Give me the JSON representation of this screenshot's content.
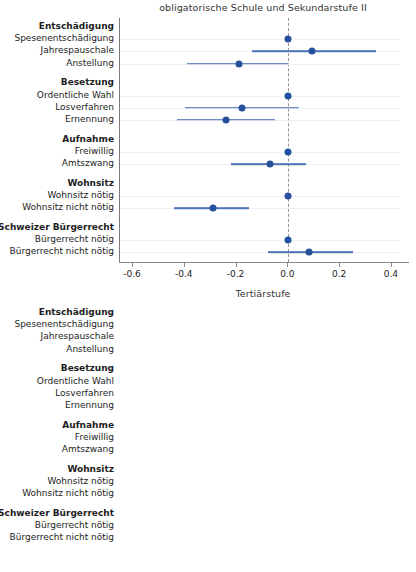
{
  "figure": {
    "width": 416,
    "height": 572,
    "point_color": "#27509b",
    "ci_color": "#4a73b8",
    "zero_line_color": "#9a9287",
    "grid_color": "#eceff4"
  },
  "chart_data": [
    {
      "type": "scatter",
      "title": "obligatorische Schule und Sekundarstufe II",
      "xlabel": "",
      "ylabel": "",
      "xlim": [
        -0.65,
        0.47
      ],
      "xticks": [
        -0.6,
        -0.4,
        -0.2,
        0.0,
        0.2,
        0.4
      ],
      "xticklabels": [
        "-0.6",
        "-0.4",
        "-0.2",
        "0.0",
        "0.2",
        "0.4"
      ],
      "grid": true,
      "legend": "none",
      "reference_line": 0.0,
      "groups": [
        {
          "name": "Entschädigung",
          "rows": [
            {
              "label": "Spesenentschädigung",
              "estimate": 0.0,
              "ci_low": null,
              "ci_high": null,
              "reference": true
            },
            {
              "label": "Jahrespauschale",
              "estimate": 0.09,
              "ci_low": -0.14,
              "ci_high": 0.34,
              "reference": false
            },
            {
              "label": "Anstellung",
              "estimate": -0.19,
              "ci_low": -0.39,
              "ci_high": 0.0,
              "reference": false
            }
          ]
        },
        {
          "name": "Besetzung",
          "rows": [
            {
              "label": "Ordentliche Wahl",
              "estimate": 0.0,
              "ci_low": null,
              "ci_high": null,
              "reference": true
            },
            {
              "label": "Losverfahren",
              "estimate": -0.18,
              "ci_low": -0.4,
              "ci_high": 0.04,
              "reference": false
            },
            {
              "label": "Ernennung",
              "estimate": -0.24,
              "ci_low": -0.43,
              "ci_high": -0.05,
              "reference": false
            }
          ]
        },
        {
          "name": "Aufnahme",
          "rows": [
            {
              "label": "Freiwillig",
              "estimate": 0.0,
              "ci_low": null,
              "ci_high": null,
              "reference": true
            },
            {
              "label": "Amtszwang",
              "estimate": -0.07,
              "ci_low": -0.22,
              "ci_high": 0.07,
              "reference": false
            }
          ]
        },
        {
          "name": "Wohnsitz",
          "rows": [
            {
              "label": "Wohnsitz nötig",
              "estimate": 0.0,
              "ci_low": null,
              "ci_high": null,
              "reference": true
            },
            {
              "label": "Wohnsitz nicht nötig",
              "estimate": -0.29,
              "ci_low": -0.44,
              "ci_high": -0.15,
              "reference": false
            }
          ]
        },
        {
          "name": "Schweizer Bürgerrecht",
          "rows": [
            {
              "label": "Bürgerrecht nötig",
              "estimate": 0.0,
              "ci_low": null,
              "ci_high": null,
              "reference": true
            },
            {
              "label": "Bürgerrecht nicht nötig",
              "estimate": 0.08,
              "ci_low": -0.08,
              "ci_high": 0.25,
              "reference": false
            }
          ]
        }
      ]
    },
    {
      "type": "scatter",
      "title": "Tertiärstufe",
      "xlabel": "",
      "ylabel": "",
      "xlim": [
        -0.65,
        0.47
      ],
      "xticks": [
        -0.6,
        -0.4,
        -0.2,
        0.0,
        0.2,
        0.4
      ],
      "xticklabels": [
        "-0.6",
        "-0.4",
        "-0.2",
        "0.0",
        "0.2",
        "0.4"
      ],
      "grid": true,
      "legend": "none",
      "reference_line": 0.0,
      "groups": [
        {
          "name": "Entschädigung",
          "rows": [
            {
              "label": "Spesenentschädigung",
              "estimate": 0.0,
              "ci_low": null,
              "ci_high": null,
              "reference": true
            },
            {
              "label": "Jahrespauschale",
              "estimate": 0.07,
              "ci_low": -0.075,
              "ci_high": 0.22,
              "reference": false
            },
            {
              "label": "Anstellung",
              "estimate": -0.14,
              "ci_low": -0.28,
              "ci_high": 0.0,
              "reference": false
            }
          ]
        },
        {
          "name": "Besetzung",
          "rows": [
            {
              "label": "Ordentliche Wahl",
              "estimate": 0.0,
              "ci_low": null,
              "ci_high": null,
              "reference": true
            },
            {
              "label": "Losverfahren",
              "estimate": -0.19,
              "ci_low": -0.33,
              "ci_high": -0.04,
              "reference": false
            },
            {
              "label": "Ernennung",
              "estimate": -0.13,
              "ci_low": -0.255,
              "ci_high": 0.0,
              "reference": false
            }
          ]
        },
        {
          "name": "Aufnahme",
          "rows": [
            {
              "label": "Freiwillig",
              "estimate": 0.0,
              "ci_low": null,
              "ci_high": null,
              "reference": true
            },
            {
              "label": "Amtszwang",
              "estimate": -0.045,
              "ci_low": -0.16,
              "ci_high": 0.07,
              "reference": false
            }
          ]
        },
        {
          "name": "Wohnsitz",
          "rows": [
            {
              "label": "Wohnsitz nötig",
              "estimate": 0.0,
              "ci_low": null,
              "ci_high": null,
              "reference": true
            },
            {
              "label": "Wohnsitz nicht nötig",
              "estimate": -0.24,
              "ci_low": -0.345,
              "ci_high": -0.13,
              "reference": false
            }
          ]
        },
        {
          "name": "Schweizer Bürgerrecht",
          "rows": [
            {
              "label": "Bürgerrecht nötig",
              "estimate": 0.0,
              "ci_low": null,
              "ci_high": null,
              "reference": true
            },
            {
              "label": "Bürgerrecht nicht nötig",
              "estimate": 0.105,
              "ci_low": -0.01,
              "ci_high": 0.22,
              "reference": false
            }
          ]
        }
      ]
    }
  ]
}
